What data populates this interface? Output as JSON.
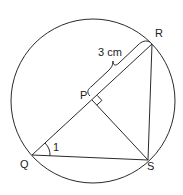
{
  "diagram": {
    "type": "circle-geometry",
    "colors": {
      "stroke": "#2a2a2a",
      "text": "#222222",
      "background": "#ffffff"
    },
    "circle": {
      "cx": 93,
      "cy": 101,
      "r": 82
    },
    "points": {
      "R": {
        "label": "R",
        "x": 152,
        "y": 44
      },
      "Q": {
        "label": "Q",
        "x": 32,
        "y": 155
      },
      "S": {
        "label": "S",
        "x": 148,
        "y": 160
      },
      "P": {
        "label": "P",
        "x": 92,
        "y": 100
      }
    },
    "segments": [
      "QR",
      "RS",
      "QS",
      "PS"
    ],
    "annotations": {
      "length_label": "3 cm",
      "angle_label": "1",
      "right_angle_at": "P"
    }
  }
}
